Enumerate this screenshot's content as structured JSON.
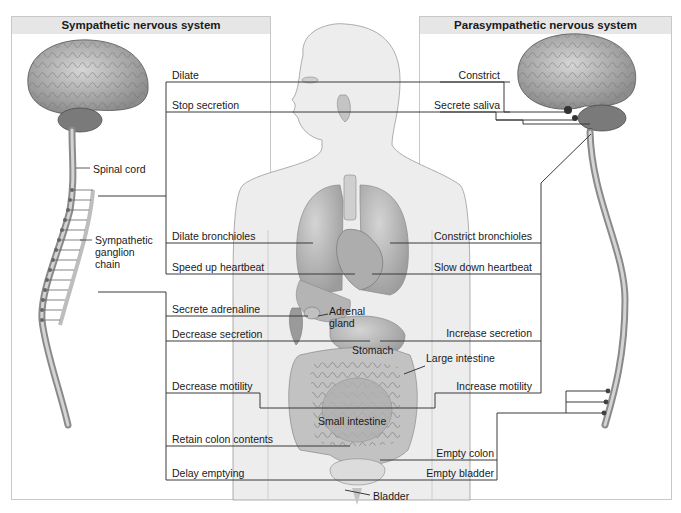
{
  "panels": {
    "sympathetic": {
      "title": "Sympathetic nervous system"
    },
    "parasympathetic": {
      "title": "Parasympathetic nervous system"
    }
  },
  "anatomy_labels": {
    "spinal_cord": "Spinal cord",
    "ganglion_chain": [
      "Sympathetic",
      "ganglion",
      "chain"
    ],
    "adrenal_gland": [
      "Adrenal",
      "gland"
    ],
    "stomach": "Stomach",
    "large_intestine": "Large intestine",
    "small_intestine": "Small intestine",
    "bladder": "Bladder"
  },
  "sympathetic_effects": [
    "Dilate",
    "Stop secretion",
    "Dilate bronchioles",
    "Speed up heartbeat",
    "Secrete adrenaline",
    "Decrease secretion",
    "Decrease motility",
    "Retain colon contents",
    "Delay emptying"
  ],
  "parasympathetic_effects": [
    "Constrict",
    "Secrete saliva",
    "Constrict bronchioles",
    "Slow down heartbeat",
    "Increase secretion",
    "Increase motility",
    "Empty colon",
    "Empty bladder"
  ],
  "colors": {
    "line": "#3a3a3a",
    "panel_header": "#e6e6e6",
    "panel_border": "#c8c8c8",
    "body_fill": "#ececec",
    "organ_fill": "#b8b8b8",
    "brain_fill": "#9a9a9a"
  }
}
